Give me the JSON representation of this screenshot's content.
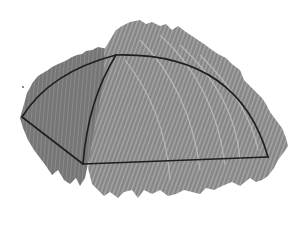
{
  "diagram": {
    "colors": {
      "background": "#ffffff",
      "hatch_dark": "#6e6e6e",
      "hatch_mid": "#8c8c8c",
      "hatch_light": "#b4b4b4",
      "outline": "#1e1e1e"
    },
    "vertices": {
      "top": [
        116,
        55
      ],
      "left": [
        22,
        117
      ],
      "bottom": [
        83,
        164
      ],
      "right": [
        268,
        157
      ]
    },
    "edges": [
      {
        "name": "left-arc",
        "from": "left",
        "to": "top",
        "type": "curve"
      },
      {
        "name": "inner-arc",
        "from": "top",
        "to": "bottom",
        "type": "curve"
      },
      {
        "name": "lower-left-edge",
        "from": "left",
        "to": "bottom",
        "type": "line"
      },
      {
        "name": "base-edge",
        "from": "bottom",
        "to": "right",
        "type": "line"
      },
      {
        "name": "outer-arc",
        "from": "top",
        "to": "right",
        "type": "curve"
      }
    ]
  }
}
